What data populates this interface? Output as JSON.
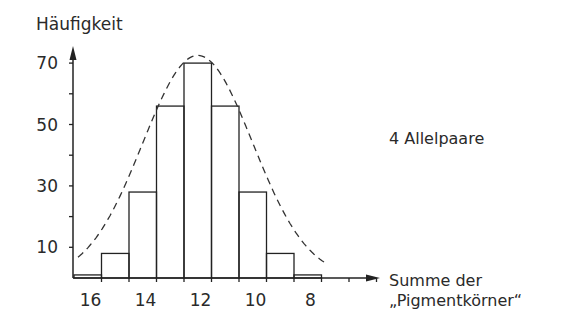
{
  "chart_data": {
    "type": "bar",
    "title": "",
    "ylabel": "Häufigkeit",
    "xlabel": "Summe der „Pigmentkörner“",
    "xlabel_lines": [
      "Summe der",
      "„Pigmentkörner“"
    ],
    "annotation": "4 Allelpaare",
    "categories": [
      "16",
      "15",
      "14",
      "13",
      "12",
      "11",
      "10",
      "9",
      "8"
    ],
    "values": [
      1,
      8,
      28,
      56,
      70,
      56,
      28,
      8,
      1
    ],
    "x_tick_labels": [
      "16",
      "14",
      "12",
      "10",
      "8"
    ],
    "y_tick_labels": [
      "10",
      "30",
      "50",
      "70"
    ],
    "y_minor_ticks": [
      20,
      40,
      60
    ],
    "ylim": [
      0,
      75
    ],
    "overlay": {
      "type": "dashed-normal-curve"
    },
    "grid": false,
    "legend": null
  }
}
